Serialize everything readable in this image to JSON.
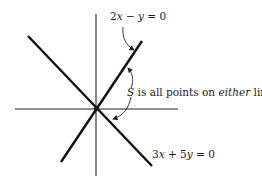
{
  "diagram": {
    "labels": {
      "line1_coef_a": "2",
      "line1_var_x": "x",
      "line1_op": " − ",
      "line1_var_y": "y",
      "line1_rhs": " = 0",
      "line2_coef_a": "3",
      "line2_var_x": "x",
      "line2_op": " + 5",
      "line2_var_y": "y",
      "line2_rhs": " = 0",
      "set_name": "S",
      "set_text_1": " is all points on ",
      "set_text_em": "either",
      "set_text_2": " line"
    },
    "equations": [
      "2x − y = 0",
      "3x + 5y = 0"
    ],
    "caption": "S is all points on either line",
    "colors": {
      "line": "#111111",
      "axis": "#222222",
      "text": "#1a1a1a"
    }
  }
}
